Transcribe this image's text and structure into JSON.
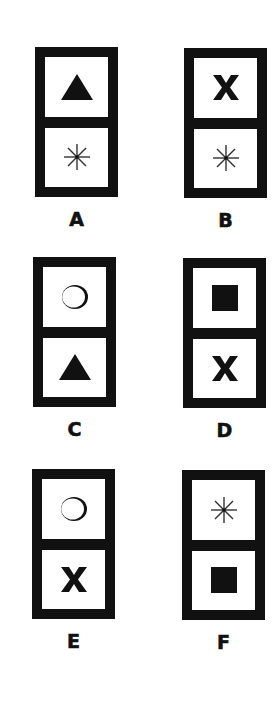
{
  "figure": {
    "type": "odd-one-out domino puzzle",
    "options": [
      {
        "label": "A",
        "top": "triangle",
        "bottom": "asterisk"
      },
      {
        "label": "B",
        "top": "x-mark",
        "bottom": "asterisk"
      },
      {
        "label": "C",
        "top": "circle",
        "bottom": "triangle"
      },
      {
        "label": "D",
        "top": "square",
        "bottom": "x-mark"
      },
      {
        "label": "E",
        "top": "circle",
        "bottom": "x-mark"
      },
      {
        "label": "F",
        "top": "asterisk",
        "bottom": "square"
      }
    ]
  },
  "colors": {
    "ink": "#111111",
    "background": "#ffffff"
  }
}
